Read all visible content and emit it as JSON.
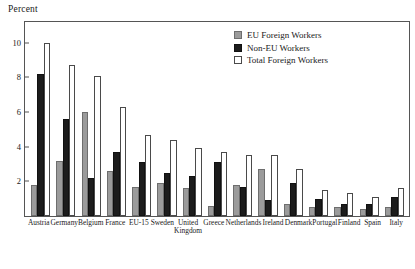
{
  "chart_data": {
    "type": "bar",
    "title": "",
    "ylabel": "Percent",
    "xlabel": "",
    "ylim": [
      0,
      11.2
    ],
    "yticks": [
      2,
      4,
      6,
      8,
      10
    ],
    "ytick_labels": [
      "2",
      "4",
      "6",
      "8",
      "10"
    ],
    "grid": false,
    "legend_position": "top-right",
    "categories": [
      "Austria",
      "Germany",
      "Belgium",
      "France",
      "EU-15",
      "Sweden",
      "United Kingdom",
      "Greece",
      "Netherlands",
      "Ireland",
      "Denmark",
      "Portugal",
      "Finland",
      "Spain",
      "Italy"
    ],
    "series": [
      {
        "name": "EU Foreign Workers",
        "color": "#9b9b9b",
        "values": [
          1.8,
          3.2,
          6.0,
          2.6,
          1.7,
          1.9,
          1.6,
          0.6,
          1.8,
          2.7,
          0.7,
          0.5,
          0.5,
          0.4,
          0.5
        ]
      },
      {
        "name": "Non-EU Workers",
        "color": "#1c1c1c",
        "values": [
          8.2,
          5.6,
          2.2,
          3.7,
          3.1,
          2.5,
          2.3,
          3.1,
          1.7,
          0.9,
          1.9,
          1.0,
          0.7,
          0.7,
          1.1
        ]
      },
      {
        "name": "Total Foreign Workers",
        "color": "#ffffff",
        "values": [
          10.0,
          8.7,
          8.1,
          6.3,
          4.7,
          4.4,
          3.9,
          3.7,
          3.5,
          3.5,
          2.7,
          1.5,
          1.3,
          1.1,
          1.6
        ]
      }
    ]
  },
  "legend": {
    "items": [
      {
        "label": "EU Foreign Workers",
        "swatch": "eu"
      },
      {
        "label": "Non-EU Workers",
        "swatch": "noneu"
      },
      {
        "label": "Total Foreign Workers",
        "swatch": "total"
      }
    ]
  }
}
